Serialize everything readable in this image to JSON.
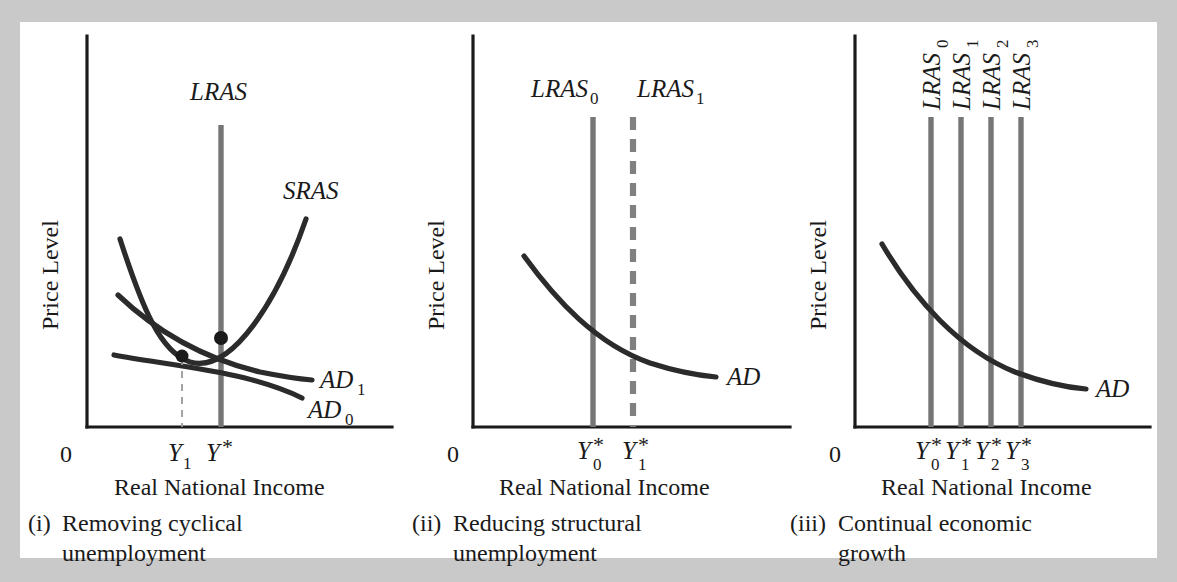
{
  "figure": {
    "type": "diagram",
    "background_color": "#c9c9c9",
    "panel_background": "#ffffff",
    "curve_color": "#2b2b2b",
    "lras_color": "#767676",
    "axis_color": "#1a1a1a"
  },
  "panels": [
    {
      "id": "panel-i",
      "caption_marker": "(i)",
      "caption_line1": "Removing cyclical",
      "caption_line2": "unemployment",
      "y_axis_label": "Price Level",
      "x_axis_label": "Real National Income",
      "origin_label": "0",
      "curves": [
        {
          "name": "LRAS",
          "label": "LRAS",
          "subscript": "",
          "style": "vertical-solid"
        },
        {
          "name": "SRAS",
          "label": "SRAS",
          "subscript": "",
          "style": "u-shaped"
        },
        {
          "name": "AD1",
          "label": "AD",
          "subscript": "1",
          "style": "downward-sloping"
        },
        {
          "name": "AD0",
          "label": "AD",
          "subscript": "0",
          "style": "downward-sloping"
        }
      ],
      "x_ticks": [
        {
          "label": "Y",
          "subscript": "1",
          "superscript": ""
        },
        {
          "label": "Y",
          "subscript": "",
          "superscript": "*"
        }
      ]
    },
    {
      "id": "panel-ii",
      "caption_marker": "(ii)",
      "caption_line1": "Reducing structural",
      "caption_line2": "unemployment",
      "y_axis_label": "Price Level",
      "x_axis_label": "Real National Income",
      "origin_label": "0",
      "curves": [
        {
          "name": "LRAS0",
          "label": "LRAS",
          "subscript": "0",
          "style": "vertical-solid"
        },
        {
          "name": "LRAS1",
          "label": "LRAS",
          "subscript": "1",
          "style": "vertical-dashed"
        },
        {
          "name": "AD",
          "label": "AD",
          "subscript": "",
          "style": "downward-sloping"
        }
      ],
      "x_ticks": [
        {
          "label": "Y",
          "subscript": "0",
          "superscript": "*"
        },
        {
          "label": "Y",
          "subscript": "1",
          "superscript": "*"
        }
      ]
    },
    {
      "id": "panel-iii",
      "caption_marker": "(iii)",
      "caption_line1": "Continual economic",
      "caption_line2": "growth",
      "y_axis_label": "Price Level",
      "x_axis_label": "Real National Income",
      "origin_label": "0",
      "curves": [
        {
          "name": "LRAS0",
          "label": "LRAS",
          "subscript": "0",
          "style": "vertical-solid-rotated-label"
        },
        {
          "name": "LRAS1",
          "label": "LRAS",
          "subscript": "1",
          "style": "vertical-solid-rotated-label"
        },
        {
          "name": "LRAS2",
          "label": "LRAS",
          "subscript": "2",
          "style": "vertical-solid-rotated-label"
        },
        {
          "name": "LRAS3",
          "label": "LRAS",
          "subscript": "3",
          "style": "vertical-solid-rotated-label"
        },
        {
          "name": "AD",
          "label": "AD",
          "subscript": "",
          "style": "downward-sloping"
        }
      ],
      "x_ticks": [
        {
          "label": "Y",
          "subscript": "0",
          "superscript": "*"
        },
        {
          "label": "Y",
          "subscript": "1",
          "superscript": "*"
        },
        {
          "label": "Y",
          "subscript": "2",
          "superscript": "*"
        },
        {
          "label": "Y",
          "subscript": "3",
          "superscript": "*"
        }
      ]
    }
  ]
}
